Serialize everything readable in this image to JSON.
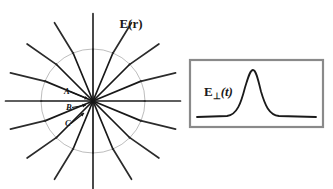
{
  "figure": {
    "background": "#ffffff",
    "width": 333,
    "height": 189
  },
  "left_panel": {
    "name": "radial-field-diagram",
    "field_label": "E(r)",
    "center": {
      "x": 93,
      "y": 101
    },
    "shell": {
      "name": "kink-shell-circle",
      "radius": 52,
      "color": "#b5b5b5",
      "stroke_width": 0.9
    },
    "line_color": "#2b2b2b",
    "line_width": 1.7,
    "inner_line_color": "#181818",
    "outer_radius": 88,
    "num_field_lines": 16,
    "field_lines": [
      {
        "angle_deg": 0,
        "kink_offset_deg": 0,
        "name": "field-line-east"
      },
      {
        "angle_deg": 22.5,
        "kink_offset_deg": -9,
        "name": "field-line-ene"
      },
      {
        "angle_deg": 45,
        "kink_offset_deg": -10,
        "name": "field-line-ne"
      },
      {
        "angle_deg": 67.5,
        "kink_offset_deg": -9,
        "name": "field-line-nne"
      },
      {
        "angle_deg": 90,
        "kink_offset_deg": 0,
        "name": "field-line-north"
      },
      {
        "angle_deg": 112.5,
        "kink_offset_deg": 9,
        "name": "field-line-nnw"
      },
      {
        "angle_deg": 135,
        "kink_offset_deg": 10,
        "name": "field-line-nw"
      },
      {
        "angle_deg": 157.5,
        "kink_offset_deg": 9,
        "name": "field-line-wnw"
      },
      {
        "angle_deg": 180,
        "kink_offset_deg": 0,
        "name": "field-line-west"
      },
      {
        "angle_deg": 202.5,
        "kink_offset_deg": -9,
        "name": "field-line-wsw"
      },
      {
        "angle_deg": 225,
        "kink_offset_deg": -10,
        "name": "field-line-sw"
      },
      {
        "angle_deg": 247.5,
        "kink_offset_deg": -9,
        "name": "field-line-ssw"
      },
      {
        "angle_deg": 270,
        "kink_offset_deg": 0,
        "name": "field-line-south"
      },
      {
        "angle_deg": 292.5,
        "kink_offset_deg": 9,
        "name": "field-line-sse"
      },
      {
        "angle_deg": 315,
        "kink_offset_deg": 10,
        "name": "field-line-se"
      },
      {
        "angle_deg": 337.5,
        "kink_offset_deg": 9,
        "name": "field-line-ese"
      }
    ],
    "annotations": [
      {
        "label": "A",
        "x": 64,
        "y": 94,
        "arrow_to_x": 88,
        "arrow_to_y": 99,
        "name": "annotation-a"
      },
      {
        "label": "B",
        "x": 66,
        "y": 110,
        "arrow_to_x": 86,
        "arrow_to_y": 105,
        "name": "annotation-b"
      },
      {
        "label": "C",
        "x": 65,
        "y": 126,
        "arrow_to_x": 84,
        "arrow_to_y": 113,
        "name": "annotation-c"
      }
    ],
    "field_label_pos": {
      "x": 131,
      "y": 28
    }
  },
  "right_panel": {
    "name": "transverse-pulse-inset",
    "label_main": "E",
    "label_sub": "⊥",
    "label_arg": "(t)",
    "label_pos": {
      "x": 204,
      "y": 96
    },
    "box": {
      "x": 190,
      "y": 60,
      "width": 133,
      "height": 67,
      "border_color": "#8a8a8a",
      "border_width": 2.2,
      "fill": "#ffffff"
    },
    "trace": {
      "name": "pulse-waveform",
      "color": "#1a1a1a",
      "stroke_width": 1.8,
      "baseline_y": 117,
      "peak_x": 253,
      "peak_y": 70,
      "start_x": 197,
      "end_x": 316
    }
  }
}
